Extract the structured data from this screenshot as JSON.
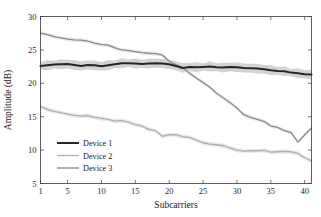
{
  "chart_data": {
    "type": "line",
    "title": "",
    "xlabel": "Subcarriers",
    "ylabel": "Amplitude (dB)",
    "xlim": [
      1,
      41
    ],
    "ylim": [
      5,
      30
    ],
    "xticks": [
      1,
      5,
      10,
      15,
      20,
      25,
      30,
      35,
      40
    ],
    "yticks": [
      5,
      10,
      15,
      20,
      25,
      30
    ],
    "xticklabels": [
      "1",
      "5",
      "10",
      "15",
      "20",
      "25",
      "30",
      "35",
      "40"
    ],
    "yticklabels": [
      "5",
      "10",
      "15",
      "20",
      "25",
      "30"
    ],
    "grid": false,
    "legend_position": "lower-left",
    "box": true,
    "x": [
      1,
      2,
      3,
      4,
      5,
      6,
      7,
      8,
      9,
      10,
      11,
      12,
      13,
      14,
      15,
      16,
      17,
      18,
      19,
      20,
      21,
      22,
      23,
      24,
      25,
      26,
      27,
      28,
      29,
      30,
      31,
      32,
      33,
      34,
      35,
      36,
      37,
      38,
      39,
      40,
      41
    ],
    "series": [
      {
        "name": "Device 1",
        "color": "#262626",
        "linewidth": 2.0,
        "band_color": "#c4c4c4",
        "band_opacity": 0.75,
        "band_halfwidth": 0.75,
        "values": [
          22.6,
          22.7,
          22.8,
          22.85,
          22.9,
          22.75,
          22.6,
          22.75,
          22.7,
          22.55,
          22.7,
          22.85,
          23.0,
          23.0,
          22.95,
          22.9,
          22.95,
          23.0,
          22.95,
          22.85,
          22.6,
          22.3,
          22.45,
          22.4,
          22.45,
          22.5,
          22.4,
          22.35,
          22.45,
          22.4,
          22.3,
          22.25,
          22.2,
          22.1,
          21.95,
          21.85,
          21.8,
          21.6,
          21.5,
          21.35,
          21.3
        ]
      },
      {
        "name": "Device 2",
        "color": "#b0b0b0",
        "linewidth": 1.3,
        "band_color": "#dcdcdc",
        "band_opacity": 0.6,
        "band_halfwidth": 0.35,
        "values": [
          16.5,
          16.1,
          15.8,
          15.6,
          15.4,
          15.2,
          15.1,
          15.15,
          14.9,
          14.75,
          14.6,
          14.35,
          14.4,
          14.2,
          13.8,
          13.6,
          13.1,
          12.9,
          12.05,
          12.3,
          12.3,
          12.0,
          11.9,
          11.5,
          11.1,
          10.9,
          10.8,
          10.65,
          10.3,
          10.0,
          9.85,
          9.9,
          9.9,
          9.95,
          9.7,
          9.75,
          9.8,
          9.75,
          9.5,
          8.85,
          8.4
        ]
      },
      {
        "name": "Device 3",
        "color": "#8a8a8a",
        "linewidth": 1.3,
        "band_color": "#dcdcdc",
        "band_opacity": 0.55,
        "band_halfwidth": 0.35,
        "values": [
          27.5,
          27.3,
          27.0,
          26.8,
          26.6,
          26.5,
          26.45,
          26.3,
          26.0,
          25.8,
          25.7,
          25.3,
          25.0,
          24.9,
          24.75,
          24.6,
          24.5,
          24.45,
          24.2,
          23.3,
          22.8,
          22.35,
          21.5,
          20.8,
          20.1,
          19.4,
          18.5,
          17.8,
          17.1,
          16.3,
          15.3,
          14.9,
          14.6,
          14.3,
          13.6,
          13.4,
          12.9,
          12.6,
          11.2,
          12.3,
          13.3
        ]
      }
    ]
  },
  "legend": {
    "entries": [
      {
        "label": "Device 1"
      },
      {
        "label": "Device 2"
      },
      {
        "label": "Device 3"
      }
    ]
  },
  "axes": {
    "xlabel": "Subcarriers",
    "ylabel": "Amplitude (dB)"
  }
}
